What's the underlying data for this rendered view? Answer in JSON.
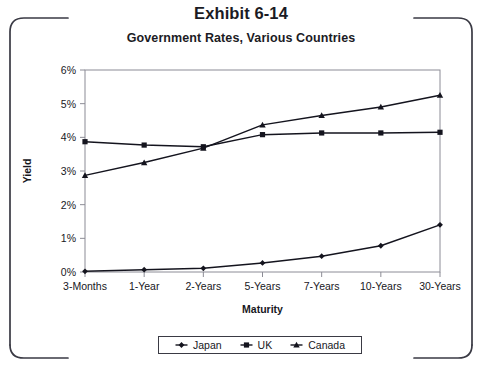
{
  "exhibit": {
    "title": "Exhibit 6-14"
  },
  "chart_data": {
    "type": "line",
    "title": "Government Rates, Various Countries",
    "xlabel": "Maturity",
    "ylabel": "Yield",
    "categories": [
      "3-Months",
      "1-Year",
      "2-Years",
      "5-Years",
      "7-Years",
      "10-Years",
      "30-Years"
    ],
    "ylim": [
      0,
      6
    ],
    "ytick_labels": [
      "0%",
      "1%",
      "2%",
      "3%",
      "4%",
      "5%",
      "6%"
    ],
    "ytick_values": [
      0,
      1,
      2,
      3,
      4,
      5,
      6
    ],
    "grid": false,
    "legend_position": "bottom",
    "series": [
      {
        "name": "Japan",
        "marker": "diamond",
        "color": "#14141e",
        "values": [
          0.02,
          0.07,
          0.11,
          0.27,
          0.47,
          0.78,
          1.4
        ]
      },
      {
        "name": "UK",
        "marker": "square",
        "color": "#14141e",
        "values": [
          3.87,
          3.77,
          3.72,
          4.08,
          4.13,
          4.13,
          4.15
        ]
      },
      {
        "name": "Canada",
        "marker": "triangle",
        "color": "#14141e",
        "values": [
          2.87,
          3.25,
          3.68,
          4.37,
          4.65,
          4.9,
          5.25
        ]
      }
    ]
  },
  "colors": {
    "ink": "#14141e",
    "frame": "#3a3a44",
    "axis": "#8c8c96",
    "background": "#ffffff"
  }
}
